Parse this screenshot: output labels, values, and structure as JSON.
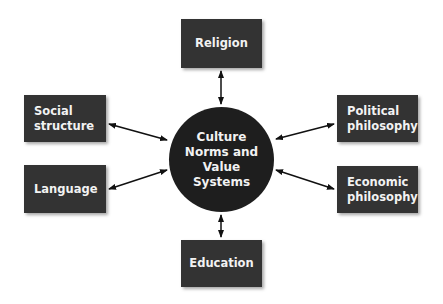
{
  "diagram": {
    "center": {
      "label": "Culture\nNorms and\nValue\nSystems"
    },
    "nodes": [
      {
        "id": "religion",
        "label": "Religion"
      },
      {
        "id": "social-structure",
        "label": "Social\nstructure"
      },
      {
        "id": "language",
        "label": "Language"
      },
      {
        "id": "political-philosophy",
        "label": "Political\nphilosophy"
      },
      {
        "id": "economic-philosophy",
        "label": "Economic\nphilosophy"
      },
      {
        "id": "education",
        "label": "Education"
      }
    ],
    "edges": [
      {
        "from": "center",
        "to": "religion",
        "type": "bidirectional"
      },
      {
        "from": "center",
        "to": "social-structure",
        "type": "bidirectional"
      },
      {
        "from": "center",
        "to": "language",
        "type": "bidirectional"
      },
      {
        "from": "center",
        "to": "political-philosophy",
        "type": "bidirectional"
      },
      {
        "from": "center",
        "to": "economic-philosophy",
        "type": "bidirectional"
      },
      {
        "from": "center",
        "to": "education",
        "type": "bidirectional"
      }
    ],
    "colors": {
      "box": "#333333",
      "hub": "#1e1e1e",
      "text": "#f2f2f2",
      "arrow": "#111111"
    }
  }
}
